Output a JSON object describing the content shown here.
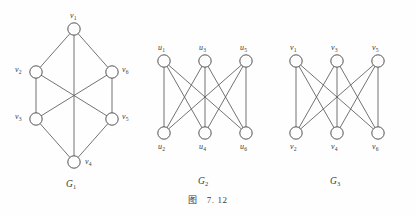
{
  "figure": {
    "caption_prefix": "图",
    "caption_number": "7. 12",
    "background_color": "#fefefe",
    "ink_color": "#4a4a4a"
  },
  "graphs": [
    {
      "id": "G1",
      "name_main": "G",
      "name_sub": "1",
      "type": "hexagonal-with-diagonals",
      "vertex_count": 6,
      "edge_count": 9,
      "vertices": [
        {
          "id": "v1",
          "label_main": "v",
          "label_sub": "1",
          "cx": 74,
          "cy": 29,
          "r": 6.2,
          "label_x": 70,
          "label_y": 12
        },
        {
          "id": "v2",
          "label_main": "v",
          "label_sub": "2",
          "cx": 36,
          "cy": 72,
          "r": 6.2,
          "label_x": 15,
          "label_y": 66
        },
        {
          "id": "v3",
          "label_main": "v",
          "label_sub": "3",
          "cx": 36,
          "cy": 119,
          "r": 6.2,
          "label_x": 15,
          "label_y": 113
        },
        {
          "id": "v4",
          "label_main": "v",
          "label_sub": "4",
          "cx": 74,
          "cy": 162,
          "r": 6.2,
          "label_x": 85,
          "label_y": 158
        },
        {
          "id": "v5",
          "label_main": "v",
          "label_sub": "5",
          "cx": 112,
          "cy": 119,
          "r": 6.2,
          "label_x": 122,
          "label_y": 113
        },
        {
          "id": "v6",
          "label_main": "v",
          "label_sub": "6",
          "cx": 112,
          "cy": 72,
          "r": 6.2,
          "label_x": 122,
          "label_y": 66
        }
      ],
      "edges": [
        [
          "v1",
          "v2"
        ],
        [
          "v1",
          "v6"
        ],
        [
          "v2",
          "v3"
        ],
        [
          "v6",
          "v5"
        ],
        [
          "v3",
          "v4"
        ],
        [
          "v5",
          "v4"
        ],
        [
          "v1",
          "v4"
        ],
        [
          "v2",
          "v5"
        ],
        [
          "v3",
          "v6"
        ]
      ],
      "name_x": 66,
      "name_y": 180
    },
    {
      "id": "G2",
      "name_main": "G",
      "name_sub": "2",
      "type": "complete-bipartite-K33",
      "vertex_count": 6,
      "edge_count": 9,
      "vertices": [
        {
          "id": "u1",
          "label_main": "u",
          "label_sub": "1",
          "cx": 164,
          "cy": 61,
          "r": 6.2,
          "label_x": 158,
          "label_y": 44
        },
        {
          "id": "u3",
          "label_main": "u",
          "label_sub": "3",
          "cx": 205,
          "cy": 61,
          "r": 6.2,
          "label_x": 199,
          "label_y": 44
        },
        {
          "id": "u5",
          "label_main": "u",
          "label_sub": "5",
          "cx": 246,
          "cy": 61,
          "r": 6.2,
          "label_x": 240,
          "label_y": 44
        },
        {
          "id": "u2",
          "label_main": "u",
          "label_sub": "2",
          "cx": 164,
          "cy": 133,
          "r": 6.2,
          "label_x": 158,
          "label_y": 143
        },
        {
          "id": "u4",
          "label_main": "u",
          "label_sub": "4",
          "cx": 205,
          "cy": 133,
          "r": 6.2,
          "label_x": 199,
          "label_y": 143
        },
        {
          "id": "u6",
          "label_main": "u",
          "label_sub": "6",
          "cx": 246,
          "cy": 133,
          "r": 6.2,
          "label_x": 240,
          "label_y": 143
        }
      ],
      "edges": [
        [
          "u1",
          "u2"
        ],
        [
          "u1",
          "u4"
        ],
        [
          "u1",
          "u6"
        ],
        [
          "u3",
          "u2"
        ],
        [
          "u3",
          "u4"
        ],
        [
          "u3",
          "u6"
        ],
        [
          "u5",
          "u2"
        ],
        [
          "u5",
          "u4"
        ],
        [
          "u5",
          "u6"
        ]
      ],
      "name_x": 198,
      "name_y": 177
    },
    {
      "id": "G3",
      "name_main": "G",
      "name_sub": "3",
      "type": "complete-bipartite-K33",
      "vertex_count": 6,
      "edge_count": 9,
      "vertices": [
        {
          "id": "w1",
          "label_main": "v",
          "label_sub": "1",
          "cx": 296,
          "cy": 61,
          "r": 6.2,
          "label_x": 290,
          "label_y": 44
        },
        {
          "id": "w3",
          "label_main": "v",
          "label_sub": "3",
          "cx": 337,
          "cy": 61,
          "r": 6.2,
          "label_x": 331,
          "label_y": 44
        },
        {
          "id": "w5",
          "label_main": "v",
          "label_sub": "5",
          "cx": 378,
          "cy": 61,
          "r": 6.2,
          "label_x": 372,
          "label_y": 44
        },
        {
          "id": "w2",
          "label_main": "v",
          "label_sub": "2",
          "cx": 296,
          "cy": 133,
          "r": 6.2,
          "label_x": 290,
          "label_y": 143
        },
        {
          "id": "w4",
          "label_main": "v",
          "label_sub": "4",
          "cx": 337,
          "cy": 133,
          "r": 6.2,
          "label_x": 331,
          "label_y": 143
        },
        {
          "id": "w6",
          "label_main": "v",
          "label_sub": "6",
          "cx": 378,
          "cy": 133,
          "r": 6.2,
          "label_x": 372,
          "label_y": 143
        }
      ],
      "edges": [
        [
          "w1",
          "w2"
        ],
        [
          "w1",
          "w4"
        ],
        [
          "w1",
          "w6"
        ],
        [
          "w3",
          "w2"
        ],
        [
          "w3",
          "w4"
        ],
        [
          "w3",
          "w6"
        ],
        [
          "w5",
          "w2"
        ],
        [
          "w5",
          "w4"
        ],
        [
          "w5",
          "w6"
        ]
      ],
      "name_x": 330,
      "name_y": 177
    }
  ]
}
